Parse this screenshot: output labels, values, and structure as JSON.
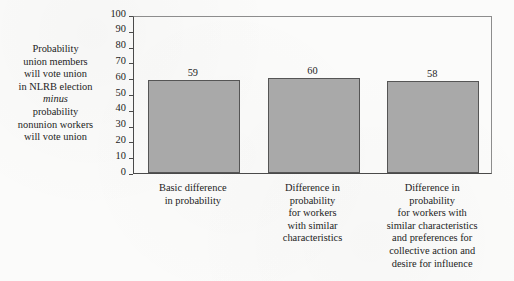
{
  "chart_data": {
    "type": "bar",
    "title": "",
    "subtitle": "",
    "xlabel": "",
    "ylabel_lines": [
      "Probability",
      "union members",
      "will vote union",
      "in NLRB election",
      "minus",
      "probability",
      "nonunion workers",
      "will vote union"
    ],
    "ylabel_italic_lines": [
      "minus"
    ],
    "categories": [
      "Basic difference in probability",
      "Difference in probability for workers with similar characteristics",
      "Difference in probability for workers with similar characteristics and preferences for collective action and desire for influence"
    ],
    "category_label_lines": [
      [
        "Basic difference",
        "in probability"
      ],
      [
        "Difference in",
        "probability",
        "for workers",
        "with similar",
        "characteristics"
      ],
      [
        "Difference in",
        "probability",
        "for workers with",
        "similar characteristics",
        "and preferences for",
        "collective action and",
        "desire for influence"
      ]
    ],
    "values": [
      59,
      60,
      58
    ],
    "value_labels": [
      "59",
      "60",
      "58"
    ],
    "ylim": [
      0,
      100
    ],
    "ytick_values": [
      0,
      10,
      20,
      30,
      40,
      50,
      60,
      70,
      80,
      90,
      100
    ],
    "ytick_labels": [
      "0",
      "10",
      "20",
      "30",
      "40",
      "50",
      "60",
      "70",
      "80",
      "90",
      "100"
    ],
    "grid": false,
    "legend": null,
    "legend_position": "none",
    "colors": {
      "bar_fill": "#a9a9a9",
      "bar_edge": "#555555",
      "axis": "#4a4a4a",
      "frame": "#8d8d8d",
      "text": "#1d1d1d",
      "background": "#fbfbfa"
    }
  }
}
